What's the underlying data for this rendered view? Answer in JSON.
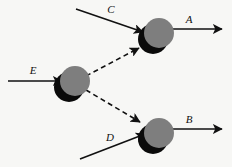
{
  "diagram": {
    "background_color": "#f7f7f5",
    "node_color": "#7e7e7e",
    "shadow_color": "#0a0a0a",
    "line_color": "#111111",
    "nodes": [
      {
        "id": "top",
        "name": "top-node",
        "cx": 157,
        "cy": 35,
        "r": 15
      },
      {
        "id": "middle",
        "name": "middle-node",
        "cx": 73,
        "cy": 82,
        "r": 15
      },
      {
        "id": "bottom",
        "name": "bottom-node",
        "cx": 157,
        "cy": 134,
        "r": 15
      }
    ],
    "edges": [
      {
        "id": "C",
        "label": "C",
        "style": "solid",
        "from": "input",
        "to": "top-node",
        "label_x": 111,
        "label_y": 13
      },
      {
        "id": "A",
        "label": "A",
        "style": "solid",
        "from": "top-node",
        "to": "output",
        "label_x": 189,
        "label_y": 23
      },
      {
        "id": "E",
        "label": "E",
        "style": "solid",
        "from": "input",
        "to": "middle-node",
        "label_x": 33,
        "label_y": 74
      },
      {
        "id": "D",
        "label": "D",
        "style": "solid",
        "from": "input",
        "to": "bottom-node",
        "label_x": 110,
        "label_y": 141
      },
      {
        "id": "B",
        "label": "B",
        "style": "solid",
        "from": "bottom-node",
        "to": "output",
        "label_x": 189,
        "label_y": 123
      },
      {
        "id": "E-to-top",
        "label": "",
        "style": "dashed",
        "from": "middle-node",
        "to": "top-node"
      },
      {
        "id": "E-to-bottom",
        "label": "",
        "style": "dashed",
        "from": "middle-node",
        "to": "bottom-node"
      }
    ],
    "labels": {
      "a": "A",
      "b": "B",
      "c": "C",
      "d": "D",
      "e": "E"
    }
  }
}
